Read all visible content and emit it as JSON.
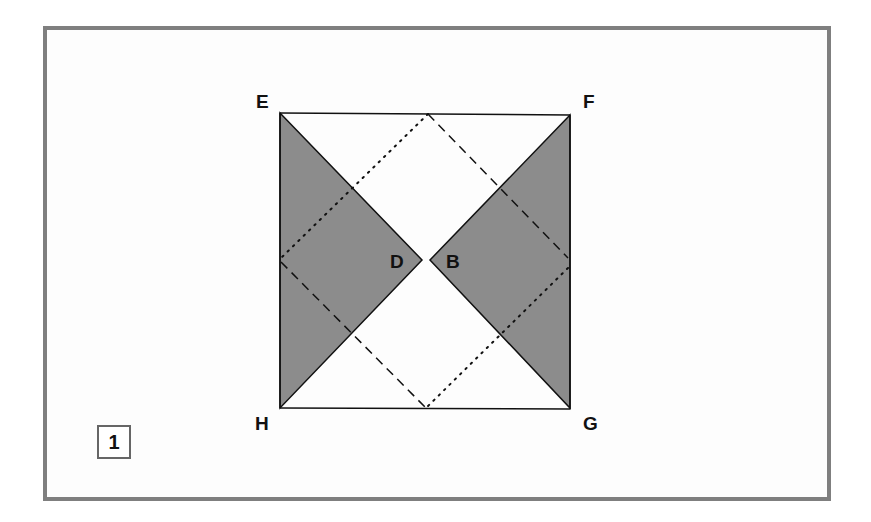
{
  "diagram": {
    "labels": {
      "E": "E",
      "F": "F",
      "G": "G",
      "H": "H",
      "D": "D",
      "B": "B"
    },
    "step_number": "1",
    "colors": {
      "frame": "#7f7f7f",
      "shade": "#8c8c8c",
      "line": "#111111"
    }
  }
}
